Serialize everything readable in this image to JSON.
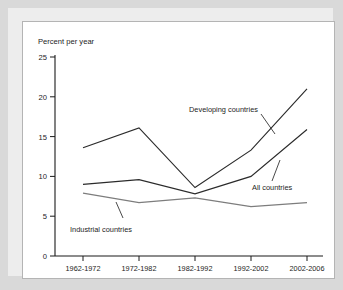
{
  "chart_data": {
    "type": "line",
    "title": "",
    "ylabel": "Percent per year",
    "xlabel": "",
    "categories": [
      "1962-1972",
      "1972-1982",
      "1982-1992",
      "1992-2002",
      "2002-2006"
    ],
    "ylim": [
      0,
      25
    ],
    "yticks": [
      0,
      5,
      10,
      15,
      20,
      25
    ],
    "ytick_labels": [
      "0",
      "5",
      "10",
      "15",
      "20",
      "25"
    ],
    "grid": false,
    "legend_position": "inline-annotations",
    "series": [
      {
        "name": "Developing countries",
        "values": [
          13.6,
          16.1,
          8.6,
          13.3,
          21.0
        ],
        "color": "#2b2b2b"
      },
      {
        "name": "All countries",
        "values": [
          9.0,
          9.6,
          7.8,
          10.0,
          15.9
        ],
        "color": "#2b2b2b"
      },
      {
        "name": "Industrial countries",
        "values": [
          7.9,
          6.7,
          7.3,
          6.2,
          6.7
        ],
        "color": "#7d7d7d"
      }
    ],
    "annotations": [
      {
        "label": "Developing countries",
        "series": "Developing countries"
      },
      {
        "label": "All countries",
        "series": "All countries"
      },
      {
        "label": "Industrial countries",
        "series": "Industrial countries"
      }
    ]
  },
  "axis": {
    "ytick_0": "0",
    "ytick_5": "5",
    "ytick_10": "10",
    "ytick_15": "15",
    "ytick_20": "20",
    "ytick_25": "25",
    "xtick_0": "1962-1972",
    "xtick_1": "1972-1982",
    "xtick_2": "1982-1992",
    "xtick_3": "1992-2002",
    "xtick_4": "2002-2006",
    "ylabel": "Percent per year"
  },
  "labels": {
    "developing": "Developing countries",
    "all": "All countries",
    "industrial": "Industrial countries"
  }
}
